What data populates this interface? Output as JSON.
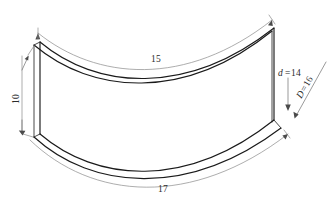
{
  "figure": {
    "background_color": "#ffffff",
    "line_color": "#1a1a1a",
    "dimension_line_color": "#8a8a8a",
    "text_color": "#2b2b2b"
  },
  "dimensions": {
    "top_arc": {
      "label": "15",
      "name": "top-length-dimension"
    },
    "bottom_arc": {
      "label": "17",
      "name": "bottom-length-dimension"
    },
    "height": {
      "label": "10",
      "name": "height-dimension"
    },
    "inner_diameter": {
      "label": "d",
      "equals": "=",
      "value": "14",
      "full_label": "d=14",
      "name": "inner-diameter-dimension"
    },
    "outer_diameter": {
      "label": "D",
      "equals": "=",
      "value": "16",
      "full_label": "D=16",
      "name": "outer-diameter-dimension"
    }
  }
}
